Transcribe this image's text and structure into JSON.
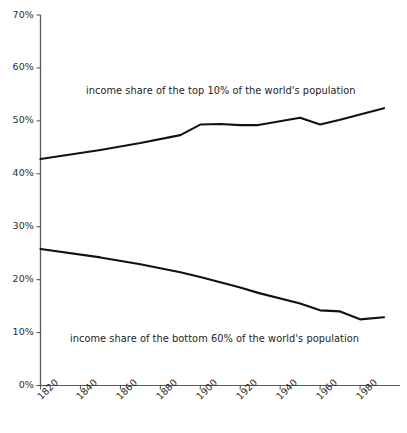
{
  "chart_data": {
    "type": "line",
    "title": "",
    "subtitle": "",
    "xlabel": "",
    "ylabel": "",
    "xlim": [
      1820,
      2000
    ],
    "ylim": [
      0,
      70
    ],
    "grid": false,
    "legend_position": "inline-annotation",
    "x_tick_labels": [
      "1820",
      "1840",
      "1860",
      "1880",
      "1900",
      "1920",
      "1940",
      "1960",
      "1980"
    ],
    "x_ticks": [
      1820,
      1840,
      1860,
      1880,
      1900,
      1920,
      1940,
      1960,
      1980
    ],
    "y_tick_labels": [
      "0%",
      "10%",
      "20%",
      "30%",
      "40%",
      "50%",
      "60%",
      "70%"
    ],
    "y_ticks": [
      0,
      10,
      20,
      30,
      40,
      50,
      60,
      70
    ],
    "x": [
      1820,
      1850,
      1870,
      1890,
      1900,
      1910,
      1920,
      1929,
      1950,
      1960,
      1970,
      1980,
      1992
    ],
    "series": [
      {
        "name": "income share of the top 10% of the world's population",
        "color": "#111111",
        "values": [
          42.8,
          44.5,
          45.8,
          47.3,
          49.3,
          49.4,
          49.2,
          49.2,
          50.6,
          49.3,
          50.2,
          51.2,
          52.4
        ]
      },
      {
        "name": "income share of the bottom 60% of the world's population",
        "color": "#111111",
        "values": [
          25.8,
          24.2,
          22.9,
          21.4,
          20.5,
          19.5,
          18.5,
          17.5,
          15.5,
          14.2,
          14.0,
          12.5,
          12.9
        ]
      }
    ],
    "annotations": [
      {
        "id": "top-series-label",
        "text": "income share of the top 10% of the world's population"
      },
      {
        "id": "bottom-series-label",
        "text": "income share of the bottom 60% of the world's population"
      }
    ],
    "axis_color": "#4d4d4d",
    "line_color": "#111111",
    "background": "#ffffff"
  }
}
